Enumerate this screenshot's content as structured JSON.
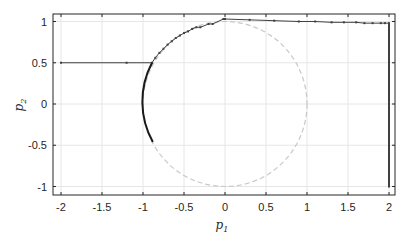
{
  "chart_data": {
    "type": "line",
    "title": "",
    "xlabel": "p1",
    "ylabel": "p2",
    "xlim": [
      -2.1,
      2.1
    ],
    "ylim": [
      -1.1,
      1.1
    ],
    "grid": true,
    "legend": null,
    "xticks": [
      -2,
      -1.5,
      -1,
      -0.5,
      0,
      0.5,
      1,
      1.5,
      2
    ],
    "xtick_labels": [
      "-2",
      "-1.5",
      "-1",
      "-0.5",
      "0",
      "0.5",
      "1",
      "1.5",
      "2"
    ],
    "yticks": [
      -1,
      -0.5,
      0,
      0.5,
      1
    ],
    "ytick_labels": [
      "-1",
      "-0.5",
      "0",
      "0.5",
      "1"
    ],
    "series": [
      {
        "name": "unit circle",
        "style": "dashed",
        "color": "#c8c8c8",
        "shape": "circle",
        "center": [
          0,
          0
        ],
        "radius": 1
      },
      {
        "name": "trajectory",
        "style": "solid-with-markers",
        "color": "#404040",
        "x": [
          -2,
          -1.2,
          -0.89,
          -0.85,
          -0.8,
          -0.75,
          -0.7,
          -0.65,
          -0.6,
          -0.55,
          -0.5,
          -0.45,
          -0.4,
          -0.35,
          -0.3,
          -0.2,
          -0.15,
          -0.02,
          0.0,
          0.3,
          0.6,
          0.9,
          1.1,
          1.3,
          1.45,
          1.6,
          1.7,
          1.8,
          1.9,
          1.95,
          2.0,
          2.0
        ],
        "y": [
          0.5,
          0.5,
          0.5,
          0.56,
          0.62,
          0.67,
          0.72,
          0.76,
          0.8,
          0.83,
          0.86,
          0.88,
          0.91,
          0.93,
          0.93,
          0.97,
          0.97,
          1.03,
          1.03,
          1.02,
          1.01,
          1.0,
          1.0,
          0.99,
          0.99,
          0.99,
          0.98,
          0.98,
          0.98,
          0.98,
          0.98,
          -1.0
        ]
      },
      {
        "name": "arc segment",
        "style": "solid-thick",
        "color": "#1a1a1a",
        "shape": "arc",
        "center": [
          0,
          0
        ],
        "radius": 1,
        "from_point": [
          -0.89,
          0.5
        ],
        "to_point": [
          -0.88,
          -0.46
        ]
      }
    ]
  },
  "colors": {
    "axis": "#262626",
    "grid": "#e6e6e6",
    "circle": "#c8c8c8",
    "trajectory": "#404040",
    "arc": "#1a1a1a"
  }
}
